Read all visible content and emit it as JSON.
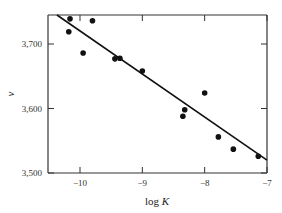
{
  "chart_data": {
    "type": "scatter",
    "title": "",
    "xlabel": "log K",
    "ylabel": "v",
    "xlim": [
      -10.5,
      -7.0
    ],
    "ylim": [
      3500,
      3745
    ],
    "x_ticks": [
      -10,
      -9,
      -8,
      -7
    ],
    "x_tick_labels": [
      "−10",
      "−9",
      "−8",
      "−7"
    ],
    "y_ticks": [
      3500,
      3600,
      3700
    ],
    "y_tick_labels": [
      "3,500",
      "3,600",
      "3,700"
    ],
    "grid": false,
    "legend": null,
    "series": [
      {
        "name": "observations",
        "kind": "points",
        "points": [
          {
            "x": -10.16,
            "y": 3739
          },
          {
            "x": -10.18,
            "y": 3719
          },
          {
            "x": -9.8,
            "y": 3736
          },
          {
            "x": -9.95,
            "y": 3686
          },
          {
            "x": -9.44,
            "y": 3677
          },
          {
            "x": -9.36,
            "y": 3678
          },
          {
            "x": -9.0,
            "y": 3658
          },
          {
            "x": -8.0,
            "y": 3624
          },
          {
            "x": -8.32,
            "y": 3598
          },
          {
            "x": -8.35,
            "y": 3588
          },
          {
            "x": -7.78,
            "y": 3556
          },
          {
            "x": -7.54,
            "y": 3537
          },
          {
            "x": -7.14,
            "y": 3526
          }
        ]
      },
      {
        "name": "fit",
        "kind": "line",
        "points": [
          {
            "x": -10.37,
            "y": 3745
          },
          {
            "x": -7.0,
            "y": 3520
          }
        ]
      }
    ]
  }
}
